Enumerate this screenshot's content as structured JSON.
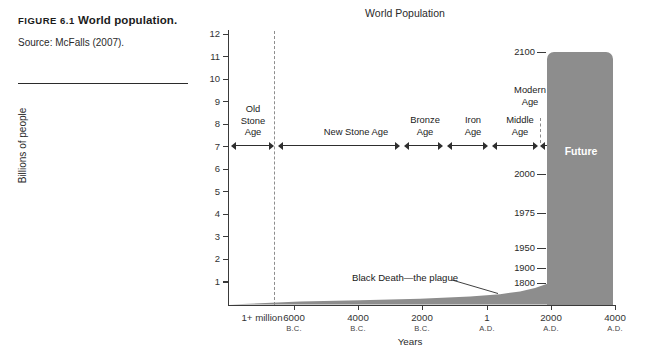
{
  "caption": {
    "figure_label": "FIGURE 6.1",
    "title": "World population.",
    "source": "Source: McFalls (2007)."
  },
  "chart_data": {
    "type": "area",
    "title": "World Population",
    "xlabel": "Years",
    "ylabel": "Billions of people",
    "ylim": [
      0,
      12
    ],
    "yticks": [
      12,
      11,
      10,
      9,
      8,
      7,
      6,
      5,
      4,
      3,
      2,
      1
    ],
    "grid": false,
    "legend_position": "none",
    "x_tick_labels": [
      {
        "value": "1+ million",
        "era": ""
      },
      {
        "value": "6000",
        "era": "B.C."
      },
      {
        "value": "4000",
        "era": "B.C."
      },
      {
        "value": "2000",
        "era": "B.C."
      },
      {
        "value": "1",
        "era": "A.D."
      },
      {
        "value": "2000",
        "era": "A.D."
      },
      {
        "value": "4000",
        "era": "A.D."
      }
    ],
    "series": [
      {
        "name": "World population",
        "description": "Flat near zero from 1+ million years ago until roughly 1800 A.D., then a near-vertical rise to about 10.8 billion projected by 2100.",
        "points": [
          {
            "year": "1+ million B.C.",
            "billions": 0.0
          },
          {
            "year": "6000 B.C.",
            "billions": 0.01
          },
          {
            "year": "4000 B.C.",
            "billions": 0.03
          },
          {
            "year": "2000 B.C.",
            "billions": 0.07
          },
          {
            "year": "1 A.D.",
            "billions": 0.2
          },
          {
            "year": "1800",
            "billions": 1.0
          },
          {
            "year": "1900",
            "billions": 1.6
          },
          {
            "year": "1950",
            "billions": 2.5
          },
          {
            "year": "1975",
            "billions": 4.0
          },
          {
            "year": "2000",
            "billions": 6.1
          },
          {
            "year": "2100",
            "billions": 10.8
          }
        ]
      }
    ],
    "year_markers": [
      {
        "label": "2100"
      },
      {
        "label": "2000"
      },
      {
        "label": "1975"
      },
      {
        "label": "1950"
      },
      {
        "label": "1900"
      },
      {
        "label": "1800"
      }
    ],
    "eras": [
      {
        "label": "Old Stone Age"
      },
      {
        "label": "New Stone Age"
      },
      {
        "label": "Bronze Age"
      },
      {
        "label": "Iron Age"
      },
      {
        "label": "Middle Age"
      },
      {
        "label": "Modern Age"
      }
    ],
    "annotations": [
      {
        "text": "Black Death—the plague"
      },
      {
        "text": "Future"
      }
    ],
    "colors": {
      "fill": "#8d8d8d",
      "axis": "#3a3a3a",
      "future_text": "#ffffff"
    }
  }
}
